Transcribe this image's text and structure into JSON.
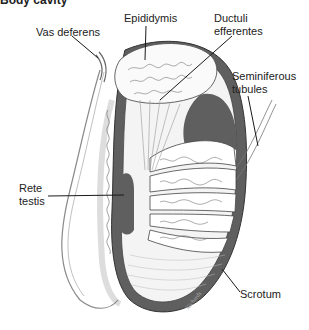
{
  "caption": {
    "visible_start": "Body cavity",
    "clipped_rest": "... (cut off)"
  },
  "labels": {
    "vas_deferens": "Vas deferens",
    "epididymis": "Epididymis",
    "ductuli_line1": "Ductuli",
    "ductuli_line2": "efferentes",
    "seminiferous_line1": "Seminiferous",
    "seminiferous_line2": "tubules",
    "rete_line1": "Rete",
    "rete_line2": "testis",
    "scrotum": "Scrotum",
    "signature": "Richards"
  },
  "colors": {
    "tunica_dark": "#5f5f5f",
    "line": "#333333",
    "light_line": "#9a9a9a"
  }
}
